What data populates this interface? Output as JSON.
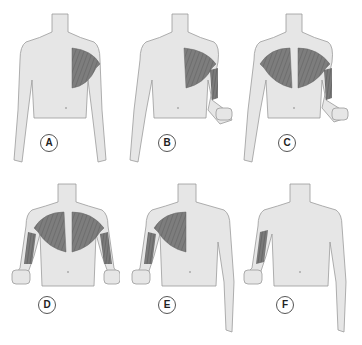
{
  "figure": {
    "colors": {
      "skin": "#e6e6e6",
      "outline": "#9a9a9a",
      "muscle": "#7a7a7a",
      "muscle_fiber": "#5a5a5a",
      "background": "#ffffff"
    },
    "panels": [
      {
        "label": "A",
        "highlighted": [
          "left pectoralis major (viewer's right)"
        ]
      },
      {
        "label": "B",
        "highlighted": [
          "left pectoralis major",
          "left biceps"
        ],
        "arm_flexed": "right-side"
      },
      {
        "label": "C",
        "highlighted": [
          "both pectoralis major",
          "left biceps"
        ],
        "arm_flexed": "right-side"
      },
      {
        "label": "D",
        "highlighted": [
          "both pectoralis major",
          "both biceps"
        ],
        "arm_flexed": "both"
      },
      {
        "label": "E",
        "highlighted": [
          "right pectoralis major",
          "right biceps"
        ],
        "arm_flexed": "left-side"
      },
      {
        "label": "F",
        "highlighted": [
          "right biceps"
        ],
        "arm_flexed": "left-side"
      }
    ]
  }
}
